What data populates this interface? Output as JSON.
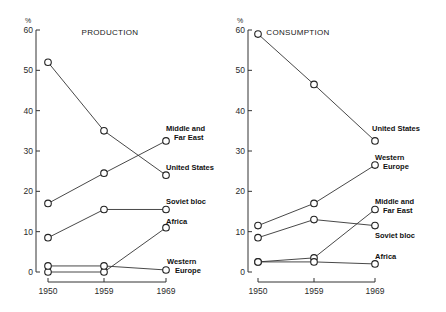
{
  "chart_data": [
    {
      "type": "line",
      "title": "PRODUCTION",
      "ylabel": "%",
      "xlabel": "",
      "x": [
        "1950",
        "1959",
        "1969"
      ],
      "ylim": [
        0,
        60
      ],
      "yticks": [
        0,
        10,
        20,
        30,
        40,
        50,
        60
      ],
      "grid": false,
      "legend": "inline labels at line ends",
      "series": [
        {
          "name": "United States",
          "values": [
            52,
            35,
            24
          ]
        },
        {
          "name": "Middle and Far East",
          "values": [
            17,
            24.5,
            32.5
          ]
        },
        {
          "name": "Soviet bloc",
          "values": [
            8.5,
            15.5,
            15.5
          ]
        },
        {
          "name": "Africa",
          "values": [
            0,
            0,
            11
          ]
        },
        {
          "name": "Western Europe",
          "values": [
            1.5,
            1.5,
            0.5
          ]
        }
      ]
    },
    {
      "type": "line",
      "title": "CONSUMPTION",
      "ylabel": "%",
      "xlabel": "",
      "x": [
        "1950",
        "1959",
        "1969"
      ],
      "ylim": [
        0,
        60
      ],
      "yticks": [
        0,
        10,
        20,
        30,
        40,
        50,
        60
      ],
      "grid": false,
      "legend": "inline labels at line ends",
      "series": [
        {
          "name": "United States",
          "values": [
            59,
            46.5,
            32.5
          ]
        },
        {
          "name": "Western Europe",
          "values": [
            11.5,
            17,
            26.5
          ]
        },
        {
          "name": "Soviet bloc",
          "values": [
            8.5,
            13,
            11.5
          ]
        },
        {
          "name": "Middle and Far East",
          "values": [
            2.5,
            3.5,
            15.5
          ]
        },
        {
          "name": "Africa",
          "values": [
            2.5,
            2.5,
            2
          ]
        }
      ]
    }
  ],
  "panels": [
    {
      "title": "PRODUCTION",
      "unit": "%",
      "labels": [
        {
          "lines": [
            "Middle and",
            "Far East"
          ]
        },
        {
          "lines": [
            "United States"
          ]
        },
        {
          "lines": [
            "Soviet bloc"
          ]
        },
        {
          "lines": [
            "Africa"
          ]
        },
        {
          "lines": [
            "Western",
            "Europe"
          ]
        }
      ]
    },
    {
      "title": "CONSUMPTION",
      "unit": "%",
      "labels": [
        {
          "lines": [
            "United States"
          ]
        },
        {
          "lines": [
            "Western",
            "Europe"
          ]
        },
        {
          "lines": [
            "Middle and",
            "Far East"
          ]
        },
        {
          "lines": [
            "Soviet bloc"
          ]
        },
        {
          "lines": [
            "Africa"
          ]
        }
      ]
    }
  ]
}
